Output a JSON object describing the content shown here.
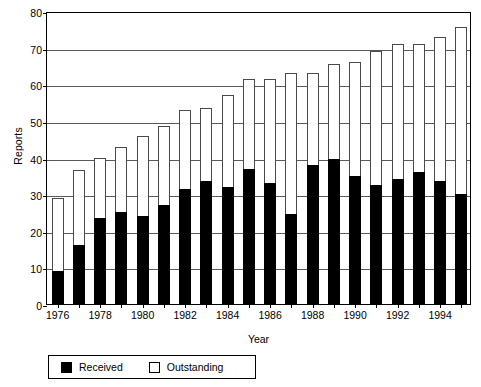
{
  "chart_data": {
    "type": "bar",
    "subtype": "stacked",
    "title": "",
    "xlabel": "Year",
    "ylabel": "Reports",
    "ylim": [
      0,
      80
    ],
    "ytick_step": 10,
    "yticks": [
      0,
      10,
      20,
      30,
      40,
      50,
      60,
      70,
      80
    ],
    "grid": true,
    "legend_position": "bottom-left",
    "xticks_labeled": [
      1976,
      1978,
      1980,
      1982,
      1984,
      1986,
      1988,
      1990,
      1992,
      1994
    ],
    "categories": [
      "1976",
      "1977",
      "1978",
      "1979",
      "1980",
      "1981",
      "1982",
      "1983",
      "1984",
      "1985",
      "1986",
      "1987",
      "1988",
      "1989",
      "1990",
      "1991",
      "1992",
      "1993",
      "1994",
      "1995"
    ],
    "series": [
      {
        "name": "Received",
        "color": "#000000",
        "values": [
          9,
          16,
          23.5,
          25,
          24,
          27,
          31.5,
          33.5,
          32,
          37,
          33,
          24.5,
          38,
          39.5,
          35,
          32.5,
          34,
          36,
          33.5,
          30
        ]
      },
      {
        "name": "Outstanding",
        "color": "#ffffff",
        "values": [
          20,
          20.5,
          16.5,
          18,
          22,
          21.5,
          21.5,
          20,
          25,
          24.5,
          28.5,
          38.5,
          25,
          26,
          31,
          36.5,
          37,
          35,
          39.5,
          45.5
        ]
      }
    ],
    "totals": [
      29,
      36.5,
      40,
      43,
      46,
      48.5,
      53,
      53.5,
      57,
      61.5,
      61.5,
      63,
      63,
      65.5,
      66,
      69,
      71,
      71,
      73,
      75.5
    ]
  },
  "axes": {
    "y_title": "Reports",
    "x_title": "Year",
    "y_tick_labels": [
      "0",
      "10",
      "20",
      "30",
      "40",
      "50",
      "60",
      "70",
      "80"
    ],
    "x_tick_labels": [
      "1976",
      "1978",
      "1980",
      "1982",
      "1984",
      "1986",
      "1988",
      "1990",
      "1992",
      "1994"
    ]
  },
  "legend": {
    "entries": [
      {
        "label": "Received",
        "swatch": "filled-black-square"
      },
      {
        "label": "Outstanding",
        "swatch": "hollow-white-square"
      }
    ]
  }
}
